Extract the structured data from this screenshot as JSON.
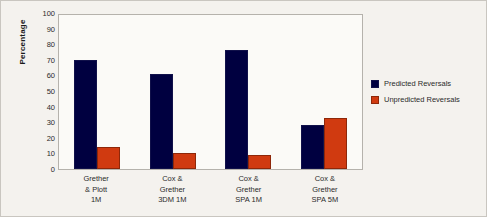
{
  "chart_data": {
    "type": "bar",
    "title": "",
    "xlabel": "",
    "ylabel": "Percentage",
    "ylim": [
      0,
      100
    ],
    "ytick_step": 10,
    "yticks": [
      100,
      90,
      80,
      70,
      60,
      50,
      40,
      30,
      20,
      10,
      0
    ],
    "grid": false,
    "legend_position": "right",
    "categories": [
      "Grether\n& Plott\n1M",
      "Cox &\nGrether\n3DM 1M",
      "Cox &\nGrether\nSPA 1M",
      "Cox &\nGrether\nSPA 5M"
    ],
    "category_lines": [
      [
        "Grether",
        "& Plott",
        "1M"
      ],
      [
        "Cox &",
        "Grether",
        "3DM 1M"
      ],
      [
        "Cox &",
        "Grether",
        "SPA 1M"
      ],
      [
        "Cox &",
        "Grether",
        "SPA 5M"
      ]
    ],
    "series": [
      {
        "name": "Predicted Reversals",
        "color": "#000040",
        "values": [
          70,
          61,
          76,
          28
        ]
      },
      {
        "name": "Unpredicted Reversals",
        "color": "#d03a10",
        "values": [
          14,
          10,
          9,
          33
        ]
      }
    ]
  },
  "legend": {
    "items": [
      {
        "label": "Predicted Reversals",
        "swatch": "predicted"
      },
      {
        "label": "Unpredicted Reversals",
        "swatch": "unpredicted"
      }
    ]
  }
}
